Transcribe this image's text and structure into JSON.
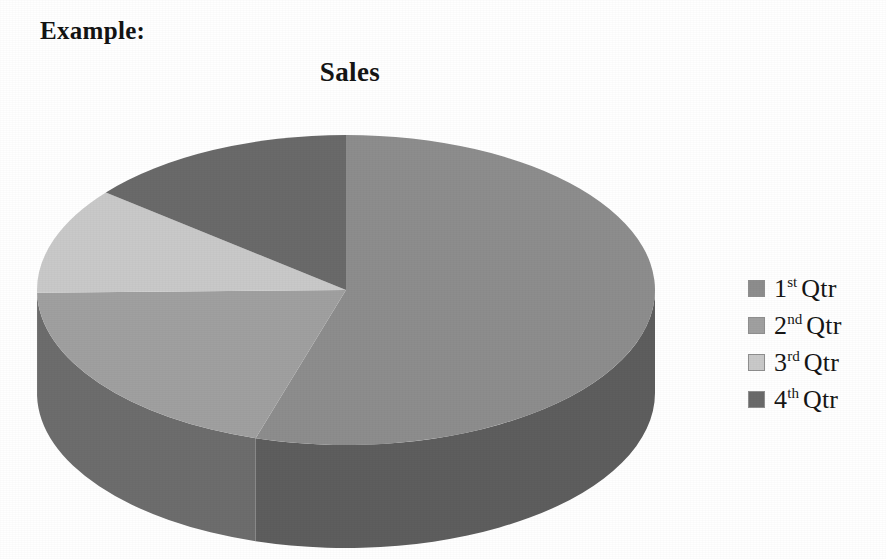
{
  "caption": {
    "text": "Example:"
  },
  "chart_data": {
    "type": "pie",
    "title": "Sales",
    "subtitle": "",
    "xlabel": "",
    "ylabel": "",
    "three_d": true,
    "grid": false,
    "legend_position": "right",
    "start_angle_deg": 0,
    "direction": "clockwise",
    "categories": [
      "1st Qtr",
      "2nd Qtr",
      "3rd Qtr",
      "4th Qtr"
    ],
    "values": [
      54.7,
      20.0,
      11.1,
      14.2
    ],
    "unit": "percent",
    "slice_angles_deg": [
      197,
      72,
      40,
      51
    ],
    "colors": [
      "#8d8d8d",
      "#a0a0a0",
      "#c9c9c9",
      "#6a6a6a"
    ],
    "side_colors": [
      "#5e5e5e",
      "#6d6d6d",
      "#8a8a8a",
      "#4a4a4a"
    ],
    "slices": [
      {
        "label": "1st Qtr",
        "ordinal": "1",
        "suffix": "st",
        "name": "Qtr",
        "value": 54.7,
        "angle_deg": 197,
        "color": "#8d8d8d"
      },
      {
        "label": "2nd Qtr",
        "ordinal": "2",
        "suffix": "nd",
        "name": "Qtr",
        "value": 20.0,
        "angle_deg": 72,
        "color": "#a0a0a0"
      },
      {
        "label": "3rd Qtr",
        "ordinal": "3",
        "suffix": "rd",
        "name": "Qtr",
        "value": 11.1,
        "angle_deg": 40,
        "color": "#c9c9c9"
      },
      {
        "label": "4th Qtr",
        "ordinal": "4",
        "suffix": "th",
        "name": "Qtr",
        "value": 14.2,
        "angle_deg": 51,
        "color": "#6a6a6a"
      }
    ]
  },
  "legend": {
    "items": [
      {
        "ordinal": "1",
        "suffix": "st",
        "name": "Qtr",
        "label": "1st Qtr",
        "color": "#8d8d8d"
      },
      {
        "ordinal": "2",
        "suffix": "nd",
        "name": "Qtr",
        "label": "2nd Qtr",
        "color": "#a0a0a0"
      },
      {
        "ordinal": "3",
        "suffix": "rd",
        "name": "Qtr",
        "label": "3rd Qtr",
        "color": "#c9c9c9"
      },
      {
        "ordinal": "4",
        "suffix": "th",
        "name": "Qtr",
        "label": "4th Qtr",
        "color": "#6a6a6a"
      }
    ]
  },
  "geometry": {
    "center_x": 346,
    "center_y": 180,
    "radius_x": 309,
    "radius_y": 155,
    "depth": 103
  }
}
